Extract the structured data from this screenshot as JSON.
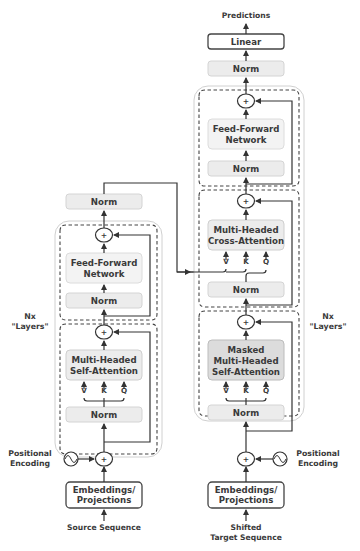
{
  "diagram": {
    "type": "transformer-encoder-decoder",
    "encoder": {
      "input_label": "Source Sequence",
      "embedding_label_line1": "Embeddings/",
      "embedding_label_line2": "Projections",
      "positional_label_line1": "Positional",
      "positional_label_line2": "Encoding",
      "layers_label_line1": "Nx",
      "layers_label_line2": "\"Layers\"",
      "attn_norm": "Norm",
      "attn_line1": "Multi-Headed",
      "attn_line2": "Self-Attention",
      "ff_norm": "Norm",
      "ff_line1": "Feed-Forward",
      "ff_line2": "Network",
      "final_norm": "Norm",
      "v": "V",
      "k": "K",
      "q": "Q",
      "plus": "+"
    },
    "decoder": {
      "input_label_line1": "Shifted",
      "input_label_line2": "Target Sequence",
      "embedding_label_line1": "Embeddings/",
      "embedding_label_line2": "Projections",
      "positional_label_line1": "Positional",
      "positional_label_line2": "Encoding",
      "layers_label_line1": "Nx",
      "layers_label_line2": "\"Layers\"",
      "masked_norm": "Norm",
      "masked_line1": "Masked",
      "masked_line2": "Multi-Headed",
      "masked_line3": "Self-Attention",
      "cross_norm": "Norm",
      "cross_line1": "Multi-Headed",
      "cross_line2": "Cross-Attention",
      "ff_norm": "Norm",
      "ff_line1": "Feed-Forward",
      "ff_line2": "Network",
      "final_norm": "Norm",
      "linear": "Linear",
      "output_label": "Predictions",
      "v": "V",
      "k": "K",
      "q": "Q",
      "plus": "+"
    },
    "colors": {
      "norm_fill": "#ececec",
      "masked_attention_fill": "#dcdcdc",
      "line": "#333333",
      "text": "#3a3a3a"
    }
  }
}
